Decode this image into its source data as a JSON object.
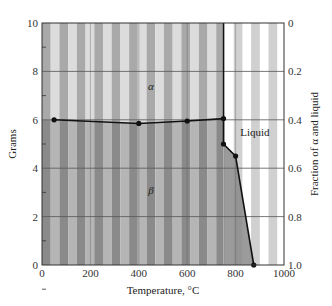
{
  "chart_data": {
    "type": "line",
    "title": "",
    "xlabel": "Temperature, °C",
    "ylabel": "Grams",
    "y2label": "Fraction of α and liquid",
    "xlim": [
      0,
      1000
    ],
    "ylim": [
      0,
      10
    ],
    "y2lim": [
      0,
      1.0
    ],
    "y2_inverted": true,
    "grid": true,
    "x_ticks": [
      0,
      200,
      400,
      600,
      800,
      1000
    ],
    "y_ticks": [
      0,
      2,
      4,
      6,
      8,
      10
    ],
    "y2_ticks": [
      "0",
      "0.2",
      "0.4",
      "0.6",
      "0.8",
      "1.0"
    ],
    "series": [
      {
        "name": "alpha-beta boundary",
        "x": [
          50,
          400,
          600,
          750
        ],
        "y": [
          6.0,
          5.85,
          5.95,
          6.05
        ]
      },
      {
        "name": "liquid boundary",
        "x": [
          750,
          750,
          800,
          875
        ],
        "y": [
          6.05,
          5.0,
          4.5,
          0
        ]
      },
      {
        "name": "solidus vertical",
        "x": [
          750,
          750
        ],
        "y": [
          10,
          6.05
        ]
      }
    ],
    "annotations": [
      {
        "text": "α",
        "x": 450,
        "y": 7.4
      },
      {
        "text": "β",
        "x": 450,
        "y": 3.1
      },
      {
        "text": "Liquid",
        "x": 880,
        "y": 5.5
      }
    ]
  },
  "labels": {
    "xlabel": "Temperature, °C",
    "ylabel": "Grams",
    "y2label": "Fraction of α and liquid",
    "alpha": "α",
    "beta": "β",
    "liquid": "Liquid"
  },
  "colors": {
    "stripe_dark_upper": "#a9a9a9",
    "stripe_light_upper": "#dcdcdc",
    "stripe_dark_lower": "#8a8a8a",
    "stripe_light_lower": "#b5b5b5",
    "liquid_bg": "#ffffff",
    "liquid_stripe": "#d0d0d0",
    "line": "#111111",
    "grid": "#555555"
  }
}
